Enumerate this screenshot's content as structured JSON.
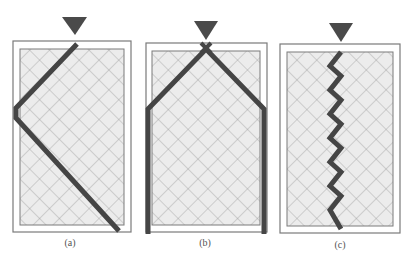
{
  "figure": {
    "colors": {
      "background": "#ffffff",
      "frame_stroke": "#7a7a7a",
      "hatch_fill": "#ececec",
      "hatch_line": "#9a9a9a",
      "crack": "#454545",
      "load_marker": "#4a4a4a"
    },
    "panels": [
      {
        "id": "a",
        "label": "(a)",
        "label_pos": [
          70,
          246
        ],
        "outer": [
          13,
          41,
          118,
          191
        ],
        "inner": [
          20,
          49,
          104,
          176
        ],
        "marker": [
          62,
          17,
          87,
          17,
          75,
          35
        ],
        "cracks": [
          {
            "points": "77,44 16,108 16,118 119,231",
            "width": 5
          }
        ]
      },
      {
        "id": "b",
        "label": "(b)",
        "label_pos": [
          205,
          246
        ],
        "outer": [
          146,
          43,
          121,
          189
        ],
        "inner": [
          152,
          51,
          108,
          174
        ],
        "marker": [
          194,
          21,
          218,
          21,
          206,
          40
        ],
        "cracks": [
          {
            "points": "148,234 148,109 206,49 264,109 264,234",
            "width": 5
          },
          {
            "points": "201,43 211,53",
            "width": 4
          },
          {
            "points": "211,43 201,53",
            "width": 4
          }
        ]
      },
      {
        "id": "c",
        "label": "(c)",
        "label_pos": [
          340,
          248
        ],
        "outer": [
          280,
          44,
          120,
          189
        ],
        "inner": [
          287,
          52,
          106,
          174
        ],
        "marker": [
          329,
          23,
          353,
          23,
          341,
          42
        ],
        "cracks": [
          {
            "points": "341,52 330,66 341,76 330,90 341,100 330,114 341,124 330,138 341,148 330,162 341,172 330,186 341,196 330,210 341,229",
            "width": 5
          }
        ]
      }
    ],
    "hatch_spacing": 14
  }
}
